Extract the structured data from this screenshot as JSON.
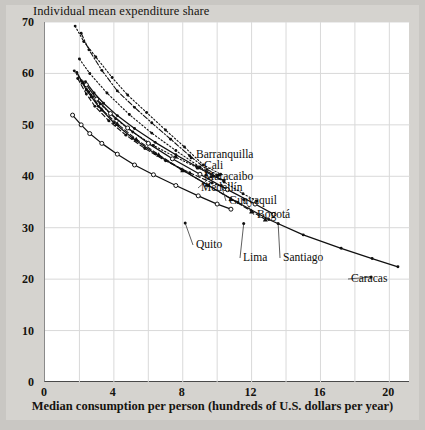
{
  "figure": {
    "ytitle": "Individual mean expenditure share",
    "xtitle": "Median consumption per person (hundreds of U.S. dollars per year)",
    "frame_color": "#c9c7c3",
    "plot_bg": "#ffffff",
    "line_color": "#101010",
    "grid_color": "#d9d9d9"
  },
  "labels": {
    "barranquilla": "Barranquilla",
    "cali": "Cali",
    "maracaibo": "Maracaibo",
    "medellin": "Medellín",
    "guayaquil": "Guayaquil",
    "bogota": "Bogotá",
    "quito": "Quito",
    "lima": "Lima",
    "santiago": "Santiago",
    "caracas": "Caracas"
  },
  "chart_data": {
    "type": "line",
    "title": "",
    "xlabel": "Median consumption per person (hundreds of U.S. dollars per year)",
    "ylabel": "Individual mean expenditure share",
    "xlim": [
      0,
      21.2
    ],
    "ylim": [
      0,
      70
    ],
    "xticks": [
      0,
      4,
      8,
      12,
      16,
      20
    ],
    "xticklabels": [
      "0",
      "4",
      "8",
      "12",
      "16",
      "20"
    ],
    "yticks": [
      0,
      10,
      20,
      30,
      40,
      50,
      60,
      70
    ],
    "yticklabels": [
      "0",
      "10",
      "20",
      "30",
      "40",
      "50",
      "60",
      "70"
    ],
    "xminorgrid": [
      2,
      6,
      10,
      14,
      18
    ],
    "grid": true,
    "legend": "inline-annotations",
    "series": [
      {
        "name": "Barranquilla",
        "marker": "dot",
        "linestyle": "dotted",
        "label_anchor": [
          8.55,
          43.6
        ],
        "points": [
          [
            1.75,
            69.2
          ],
          [
            2.25,
            66.2
          ],
          [
            2.95,
            63.2
          ],
          [
            3.9,
            59.2
          ],
          [
            4.8,
            55.8
          ],
          [
            5.9,
            52.4
          ],
          [
            7.0,
            49.0
          ],
          [
            8.1,
            45.7
          ],
          [
            9.2,
            42.2
          ],
          [
            10.2,
            40.4
          ]
        ]
      },
      {
        "name": "Cali",
        "marker": "dot",
        "linestyle": "dashdot",
        "label_anchor": [
          8.9,
          41.6
        ],
        "points": [
          [
            2.1,
            67.8
          ],
          [
            2.55,
            64.6
          ],
          [
            3.3,
            60.6
          ],
          [
            4.2,
            56.6
          ],
          [
            5.2,
            53.4
          ],
          [
            6.2,
            50.4
          ],
          [
            7.3,
            47.2
          ],
          [
            8.4,
            44.0
          ],
          [
            9.4,
            41.3
          ],
          [
            10.1,
            40.2
          ]
        ]
      },
      {
        "name": "Maracaibo",
        "marker": "dot",
        "linestyle": "dotted",
        "label_anchor": [
          9.4,
          40.2
        ],
        "points": [
          [
            1.7,
            60.5
          ],
          [
            2.1,
            58.6
          ],
          [
            2.55,
            56.4
          ],
          [
            3.2,
            54.1
          ],
          [
            4.1,
            51.2
          ],
          [
            5.1,
            48.6
          ],
          [
            6.3,
            46.0
          ],
          [
            7.6,
            43.7
          ],
          [
            8.9,
            41.6
          ],
          [
            10.0,
            40.1
          ]
        ]
      },
      {
        "name": "Medellín",
        "marker": "dot",
        "linestyle": "solid",
        "label_anchor": [
          9.7,
          39.9
        ],
        "points": [
          [
            2.35,
            58.4
          ],
          [
            2.85,
            56.2
          ],
          [
            3.4,
            54.2
          ],
          [
            4.2,
            51.8
          ],
          [
            5.2,
            49.3
          ],
          [
            6.4,
            46.6
          ],
          [
            7.6,
            44.2
          ],
          [
            8.8,
            41.9
          ],
          [
            9.8,
            40.0
          ],
          [
            10.4,
            39.2
          ]
        ]
      },
      {
        "name": "Guayaquil",
        "marker": "dot",
        "linestyle": "dashed",
        "label_anchor": [
          10.3,
          38.2
        ],
        "points": [
          [
            1.9,
            59.0
          ],
          [
            2.4,
            56.0
          ],
          [
            2.9,
            53.6
          ],
          [
            3.7,
            50.8
          ],
          [
            4.7,
            48.0
          ],
          [
            5.8,
            45.4
          ],
          [
            7.0,
            43.0
          ],
          [
            8.4,
            40.7
          ],
          [
            9.7,
            38.7
          ],
          [
            10.6,
            37.6
          ]
        ]
      },
      {
        "name": "Bogotá",
        "marker": "dot",
        "linestyle": "dotted",
        "label_anchor": [
          11.6,
          35.5
        ],
        "points": [
          [
            2.0,
            62.8
          ],
          [
            2.6,
            60.0
          ],
          [
            3.6,
            56.2
          ],
          [
            4.9,
            52.0
          ],
          [
            6.2,
            48.4
          ],
          [
            7.6,
            45.0
          ],
          [
            9.0,
            41.8
          ],
          [
            10.4,
            38.9
          ],
          [
            11.5,
            36.6
          ],
          [
            12.3,
            35.2
          ]
        ]
      },
      {
        "name": "Quito",
        "marker": "circle",
        "linestyle": "solid",
        "label_anchor": [
          8.2,
          30.9
        ],
        "points": [
          [
            1.6,
            51.9
          ],
          [
            2.1,
            50.0
          ],
          [
            2.6,
            48.3
          ],
          [
            3.3,
            46.4
          ],
          [
            4.2,
            44.3
          ],
          [
            5.2,
            42.2
          ],
          [
            6.3,
            40.3
          ],
          [
            7.6,
            38.2
          ],
          [
            8.9,
            36.2
          ],
          [
            10.0,
            34.6
          ],
          [
            10.8,
            33.6
          ]
        ]
      },
      {
        "name": "Lima",
        "marker": "triangle",
        "linestyle": "dashed",
        "label_anchor": [
          11.6,
          30.8
        ],
        "points": [
          [
            2.2,
            58.3
          ],
          [
            2.7,
            55.6
          ],
          [
            3.3,
            53.0
          ],
          [
            4.2,
            50.2
          ],
          [
            5.3,
            47.2
          ],
          [
            6.6,
            44.2
          ],
          [
            8.0,
            41.2
          ],
          [
            9.4,
            38.4
          ],
          [
            10.8,
            35.6
          ],
          [
            12.0,
            33.2
          ],
          [
            12.8,
            31.6
          ]
        ]
      },
      {
        "name": "Santiago",
        "marker": "circle",
        "linestyle": "solid",
        "label_anchor": [
          13.6,
          30.8
        ],
        "points": [
          [
            2.4,
            57.8
          ],
          [
            3.0,
            55.0
          ],
          [
            3.8,
            52.2
          ],
          [
            4.8,
            49.4
          ],
          [
            6.0,
            46.4
          ],
          [
            7.4,
            43.4
          ],
          [
            9.0,
            40.4
          ],
          [
            10.6,
            37.4
          ],
          [
            12.2,
            34.6
          ],
          [
            13.3,
            32.6
          ]
        ]
      },
      {
        "name": "Caracas",
        "marker": "dot",
        "linestyle": "solid",
        "label_anchor": [
          19.0,
          20.4
        ],
        "points": [
          [
            1.85,
            60.2
          ],
          [
            2.4,
            56.8
          ],
          [
            3.1,
            53.6
          ],
          [
            4.0,
            50.4
          ],
          [
            5.1,
            47.4
          ],
          [
            6.4,
            44.4
          ],
          [
            7.9,
            41.4
          ],
          [
            9.5,
            38.2
          ],
          [
            11.2,
            34.9
          ],
          [
            13.0,
            31.6
          ],
          [
            15.0,
            28.6
          ],
          [
            17.2,
            26.0
          ],
          [
            19.0,
            24.0
          ],
          [
            20.5,
            22.4
          ]
        ]
      }
    ]
  }
}
